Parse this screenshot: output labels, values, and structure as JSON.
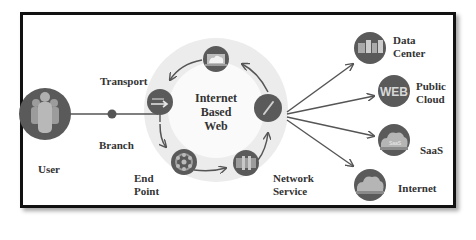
{
  "diagram": {
    "title": "Internet Based Web",
    "center_label": [
      "Internet",
      "Based",
      "Web"
    ],
    "nodes": {
      "user": {
        "label": "User",
        "icon": "users-group-icon"
      },
      "branch": {
        "label": "Branch",
        "icon": "dot-node-icon"
      },
      "transport": {
        "label": "Transport",
        "icon": "transport-arrows-icon"
      },
      "cloud_top": {
        "label": "",
        "icon": "cloud-screen-icon"
      },
      "gauge": {
        "label": "",
        "icon": "gauge-icon"
      },
      "network_service": {
        "label": [
          "Network",
          "Service"
        ],
        "icon": "network-service-icon"
      },
      "end_point": {
        "label": [
          "End",
          "Point"
        ],
        "icon": "hub-network-icon"
      }
    },
    "destinations": [
      {
        "label": [
          "Data",
          "Center"
        ],
        "icon": "data-center-icon"
      },
      {
        "label": [
          "Public",
          "Cloud"
        ],
        "icon": "web-icon",
        "glyph": "WEB"
      },
      {
        "label": [
          "SaaS"
        ],
        "icon": "saas-cloud-icon",
        "glyph": "SaaS"
      },
      {
        "label": [
          "Internet"
        ],
        "icon": "internet-cloud-icon"
      }
    ],
    "colors": {
      "node_fill": "#5a5a5a",
      "node_inner": "#a9a9a9",
      "ring": "#ececec",
      "ring_inner": "#f9f9f9",
      "arrow": "#555555",
      "frame": "#111111",
      "text": "#333333"
    }
  }
}
